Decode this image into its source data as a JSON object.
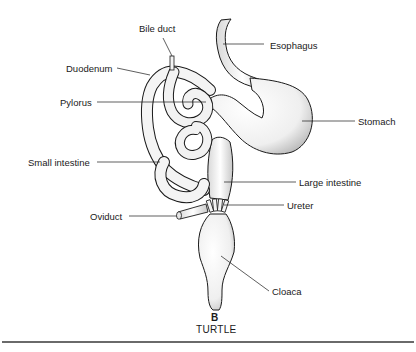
{
  "figure": {
    "panel_letter": "B",
    "title": "TURTLE"
  },
  "labels": {
    "bile_duct": "Bile duct",
    "esophagus": "Esophagus",
    "duodenum": "Duodenum",
    "pylorus": "Pylorus",
    "stomach": "Stomach",
    "small_intestine": "Small intestine",
    "large_intestine": "Large intestine",
    "oviduct": "Oviduct",
    "ureter": "Ureter",
    "cloaca": "Cloaca"
  },
  "colors": {
    "ink": "#1a1a1a",
    "organ_fill": "#f4f4f4",
    "shade": "#bdbdbd",
    "rule": "#6a6a6a"
  }
}
